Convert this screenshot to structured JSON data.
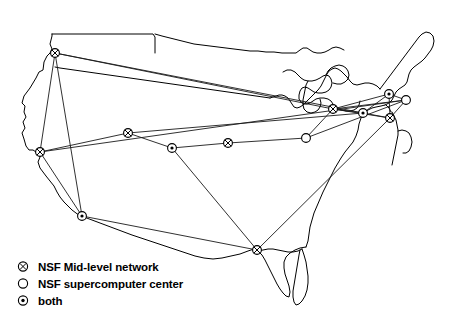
{
  "figure": {
    "background_color": "#ffffff",
    "line_color": "#1a1a1a",
    "marker_fill": "#ffffff",
    "marker_stroke": "#000000"
  },
  "legend": {
    "items": [
      {
        "marker": "circled-x-icon",
        "label": "NSF Mid-level network",
        "type": "mid_level"
      },
      {
        "marker": "open-circle-icon",
        "label": "NSF supercomputer center",
        "type": "supercomputer"
      },
      {
        "marker": "circled-dot-icon",
        "label": "both",
        "type": "both"
      }
    ]
  },
  "chart_data": {
    "type": "scatter",
    "xlabel": "",
    "ylabel": "",
    "xlim": [
      0,
      471
    ],
    "ylim": [
      0,
      314
    ],
    "grid": false,
    "legend_position": "bottom-left",
    "node_types": {
      "mid_level": "NSF Mid-level network",
      "supercomputer": "NSF supercomputer center",
      "both": "both"
    },
    "nodes": [
      {
        "id": "n1",
        "x": 55,
        "y": 53,
        "type": "mid_level"
      },
      {
        "id": "n2",
        "x": 40,
        "y": 152,
        "type": "mid_level"
      },
      {
        "id": "n3",
        "x": 82,
        "y": 216,
        "type": "both"
      },
      {
        "id": "n4",
        "x": 128,
        "y": 133,
        "type": "mid_level"
      },
      {
        "id": "n5",
        "x": 172,
        "y": 148,
        "type": "both"
      },
      {
        "id": "n6",
        "x": 228,
        "y": 143,
        "type": "mid_level"
      },
      {
        "id": "n7",
        "x": 306,
        "y": 138,
        "type": "supercomputer"
      },
      {
        "id": "n8",
        "x": 333,
        "y": 109,
        "type": "mid_level"
      },
      {
        "id": "n9",
        "x": 363,
        "y": 113,
        "type": "both"
      },
      {
        "id": "n10",
        "x": 389,
        "y": 94,
        "type": "both"
      },
      {
        "id": "n11",
        "x": 406,
        "y": 100,
        "type": "supercomputer"
      },
      {
        "id": "n12",
        "x": 390,
        "y": 118,
        "type": "mid_level"
      },
      {
        "id": "n13",
        "x": 257,
        "y": 250,
        "type": "mid_level"
      }
    ],
    "edges": [
      {
        "from": "n1",
        "to": "n2"
      },
      {
        "from": "n1",
        "to": "n3"
      },
      {
        "from": "n1",
        "to": "n8"
      },
      {
        "from": "n1",
        "to": "n9"
      },
      {
        "from": "n2",
        "to": "n3"
      },
      {
        "from": "n2",
        "to": "n4"
      },
      {
        "from": "n2",
        "to": "n11"
      },
      {
        "from": "n3",
        "to": "n13"
      },
      {
        "from": "n4",
        "to": "n5"
      },
      {
        "from": "n4",
        "to": "n9"
      },
      {
        "from": "n5",
        "to": "n6"
      },
      {
        "from": "n5",
        "to": "n13"
      },
      {
        "from": "n6",
        "to": "n7"
      },
      {
        "from": "n7",
        "to": "n8"
      },
      {
        "from": "n7",
        "to": "n11"
      },
      {
        "from": "n8",
        "to": "n9"
      },
      {
        "from": "n8",
        "to": "n10"
      },
      {
        "from": "n8",
        "to": "n11"
      },
      {
        "from": "n8",
        "to": "n12"
      },
      {
        "from": "n9",
        "to": "n10"
      },
      {
        "from": "n9",
        "to": "n12"
      },
      {
        "from": "n10",
        "to": "n11"
      },
      {
        "from": "n10",
        "to": "n12"
      },
      {
        "from": "n11",
        "to": "n12"
      },
      {
        "from": "n12",
        "to": "n13"
      }
    ]
  }
}
